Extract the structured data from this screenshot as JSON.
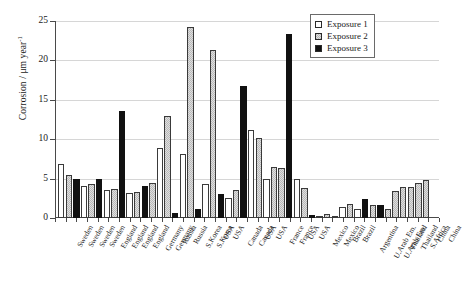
{
  "chart_data": {
    "type": "bar",
    "title": "",
    "xlabel": "",
    "ylabel": "Corrosion / μm year",
    "ylabel_exponent": "-1",
    "ylim": [
      0,
      25
    ],
    "yticks": [
      0,
      5,
      10,
      15,
      20,
      25
    ],
    "grid": true,
    "legend_position": "top-right",
    "legend": [
      "Exposure 1",
      "Exposure 2",
      "Exposure 3"
    ],
    "series_colors": {
      "Exposure 1": "#ffffff",
      "Exposure 2": "#b9b9b9",
      "Exposure 3": "#111111"
    },
    "categories": [
      "Sweden",
      "Sweden",
      "Sweden",
      "Sweden",
      "England",
      "England",
      "England",
      "England",
      "Germany",
      "Germany",
      "Russia",
      "Russia",
      "S.Korea",
      "S.Korea",
      "USA",
      "USA",
      "Canada",
      "Canada",
      "USA",
      "USA",
      "France",
      "France",
      "USA",
      "USA",
      "Mexico",
      "Mexico",
      "Brazil",
      "Brazil",
      "Argentina",
      "U.Arab Em.",
      "U.Arab Em.",
      "Thailand",
      "Thailand",
      "S.Africa",
      "China",
      "China"
    ],
    "series": [
      {
        "name": "Exposure 1",
        "values": [
          6.8,
          4.1,
          3.6,
          3.2,
          8.9,
          8.1,
          4.3,
          2.5,
          11.2,
          10.1,
          1.1,
          0.0,
          2.0,
          3.0,
          3.3,
          4.4,
          5.1,
          5.5,
          5.6,
          7.2,
          8.2,
          5.6,
          0.3,
          0.0,
          0.5,
          0.3,
          1.4,
          0.9,
          0.6,
          1.5,
          1.7,
          1.1,
          0.5,
          0.3,
          0.9,
          1.1
        ]
      },
      {
        "name": "Exposure 2",
        "values": [
          5.4,
          4.3,
          4.4,
          3.7,
          13.0,
          24.2,
          21.3,
          5.0,
          6.5,
          6.4,
          1.8,
          1.6,
          1.9,
          3.6,
          3.7,
          4.4,
          5.2,
          6.3,
          6.6,
          7.6,
          8.1,
          3.8,
          0.5,
          0.2,
          0.6,
          0.7,
          1.2,
          1.0,
          0.7,
          1.5,
          1.3,
          0.9,
          0.4,
          0.5,
          1.1,
          1.2
        ]
      },
      {
        "name": "Exposure 3",
        "values": [
          4.9,
          4.9,
          13.6,
          4.0,
          0.6,
          1.2,
          16.7,
          23.4,
          4.9,
          3.0,
          2.2,
          1.8,
          2.1,
          0.0,
          0.0,
          0.0,
          0.0,
          0.0,
          0.0,
          0.0,
          0.7,
          0.9,
          0.0,
          0.0,
          0.0,
          0.0,
          2.4,
          1.7,
          0.0,
          1.8,
          0.0,
          0.2,
          0.3,
          0.0,
          0.0,
          0.0
        ]
      }
    ],
    "bar_sequence": [
      {
        "label": "Sweden",
        "series": "Exposure 1",
        "value": 6.8
      },
      {
        "label": "Sweden",
        "series": "Exposure 2",
        "value": 5.4
      },
      {
        "label": "Sweden",
        "series": "Exposure 3",
        "value": 4.9
      },
      {
        "label": "Sweden",
        "series": "Exposure 1",
        "value": 4.1
      },
      {
        "label": "Sweden",
        "series": "Exposure 2",
        "value": 4.3
      },
      {
        "label": "Sweden",
        "series": "Exposure 3",
        "value": 4.9
      },
      {
        "label": "Sweden",
        "series": "Exposure 1",
        "value": 3.6
      },
      {
        "label": "Sweden",
        "series": "Exposure 3",
        "value": 13.6
      },
      {
        "label": "Sweden",
        "series": "Exposure 1",
        "value": 3.2
      },
      {
        "label": "Sweden",
        "series": "Exposure 2",
        "value": 3.3
      },
      {
        "label": "England",
        "series": "Exposure 2",
        "value": 4.4
      },
      {
        "label": "England",
        "series": "Exposure 3",
        "value": 4.0
      },
      {
        "label": "England",
        "series": "Exposure 1",
        "value": 8.9
      },
      {
        "label": "England",
        "series": "Exposure 2",
        "value": 13.0
      },
      {
        "label": "England",
        "series": "Exposure 3",
        "value": 0.6
      },
      {
        "label": "England",
        "series": "Exposure 2",
        "value": 24.2
      },
      {
        "label": "England",
        "series": "Exposure 1",
        "value": 8.1
      },
      {
        "label": "England",
        "series": "Exposure 3",
        "value": 1.2
      },
      {
        "label": "England",
        "series": "Exposure 2",
        "value": 21.3
      },
      {
        "label": "England",
        "series": "Exposure 1",
        "value": 4.3
      },
      {
        "label": "Germany",
        "series": "Exposure 3",
        "value": 3.0
      },
      {
        "label": "Germany",
        "series": "Exposure 1",
        "value": 2.5
      },
      {
        "label": "Germany",
        "series": "Exposure 3",
        "value": 16.7
      },
      {
        "label": "Germany",
        "series": "Exposure 1",
        "value": 11.2
      },
      {
        "label": "Germany",
        "series": "Exposure 2",
        "value": 3.6
      },
      {
        "label": "Germany",
        "series": "Exposure 1",
        "value": 10.1
      },
      {
        "label": "Russia",
        "series": "Exposure 2",
        "value": 5.0
      },
      {
        "label": "Russia",
        "series": "Exposure 1",
        "value": 6.5
      },
      {
        "label": "Russia",
        "series": "Exposure 3",
        "value": 23.4
      },
      {
        "label": "Russia",
        "series": "Exposure 2",
        "value": 4.9
      },
      {
        "label": "S.Korea",
        "series": "Exposure 1",
        "value": 6.4
      },
      {
        "label": "S.Korea",
        "series": "Exposure 2",
        "value": 3.8
      },
      {
        "label": "S.Korea",
        "series": "Exposure 3",
        "value": 2.2
      },
      {
        "label": "S.Korea",
        "series": "Exposure 1",
        "value": 1.4
      },
      {
        "label": "USA",
        "series": "Exposure 2",
        "value": 1.8
      },
      {
        "label": "USA",
        "series": "Exposure 3",
        "value": 2.4
      },
      {
        "label": "USA",
        "series": "Exposure 1",
        "value": 1.2
      },
      {
        "label": "USA",
        "series": "Exposure 3",
        "value": 1.8
      },
      {
        "label": "Canada",
        "series": "Exposure 2",
        "value": 1.9
      },
      {
        "label": "Canada",
        "series": "Exposure 1",
        "value": 3.4
      },
      {
        "label": "Canada",
        "series": "Exposure 2",
        "value": 3.9
      },
      {
        "label": "USA",
        "series": "Exposure 1",
        "value": 3.9
      },
      {
        "label": "USA",
        "series": "Exposure 2",
        "value": 4.5
      },
      {
        "label": "France",
        "series": "Exposure 1",
        "value": 4.8
      },
      {
        "label": "France",
        "series": "Exposure 2",
        "value": 5.2
      }
    ],
    "note": "Grouped bar chart of atmospheric corrosion rate by test site and exposure period."
  },
  "bars_render": [
    {
      "x": 2.0,
      "h": 6.8,
      "cls": "e1"
    },
    {
      "x": 9.6,
      "h": 5.4,
      "cls": "e2"
    },
    {
      "x": 17.2,
      "h": 4.9,
      "cls": "e3"
    },
    {
      "x": 24.8,
      "h": 4.1,
      "cls": "e1"
    },
    {
      "x": 32.4,
      "h": 4.3,
      "cls": "e2"
    },
    {
      "x": 40.0,
      "h": 4.9,
      "cls": "e3"
    },
    {
      "x": 47.6,
      "h": 3.6,
      "cls": "e1"
    },
    {
      "x": 55.2,
      "h": 3.7,
      "cls": "e2"
    },
    {
      "x": 62.8,
      "h": 13.6,
      "cls": "e3"
    },
    {
      "x": 70.4,
      "h": 3.2,
      "cls": "e1"
    },
    {
      "x": 78.0,
      "h": 3.3,
      "cls": "e2"
    },
    {
      "x": 85.6,
      "h": 4.0,
      "cls": "e3"
    },
    {
      "x": 93.2,
      "h": 4.4,
      "cls": "e2"
    },
    {
      "x": 100.8,
      "h": 8.9,
      "cls": "e1"
    },
    {
      "x": 108.4,
      "h": 13.0,
      "cls": "e2"
    },
    {
      "x": 116.0,
      "h": 0.6,
      "cls": "e3"
    },
    {
      "x": 123.6,
      "h": 8.1,
      "cls": "e1"
    },
    {
      "x": 131.2,
      "h": 24.2,
      "cls": "e2"
    },
    {
      "x": 138.8,
      "h": 1.2,
      "cls": "e3"
    },
    {
      "x": 146.4,
      "h": 4.3,
      "cls": "e1"
    },
    {
      "x": 154.0,
      "h": 21.3,
      "cls": "e2"
    },
    {
      "x": 161.6,
      "h": 3.0,
      "cls": "e3"
    },
    {
      "x": 169.2,
      "h": 2.5,
      "cls": "e1"
    },
    {
      "x": 176.8,
      "h": 3.6,
      "cls": "e2"
    },
    {
      "x": 184.4,
      "h": 16.7,
      "cls": "e3"
    },
    {
      "x": 192.0,
      "h": 11.2,
      "cls": "e1"
    },
    {
      "x": 199.6,
      "h": 10.1,
      "cls": "e2"
    },
    {
      "x": 207.2,
      "h": 5.0,
      "cls": "e1"
    },
    {
      "x": 214.8,
      "h": 6.5,
      "cls": "e2"
    },
    {
      "x": 222.4,
      "h": 6.4,
      "cls": "e2"
    },
    {
      "x": 230.0,
      "h": 23.4,
      "cls": "e3"
    },
    {
      "x": 237.6,
      "h": 4.9,
      "cls": "e1"
    },
    {
      "x": 245.2,
      "h": 3.8,
      "cls": "e2"
    },
    {
      "x": 252.8,
      "h": 0.4,
      "cls": "e3"
    },
    {
      "x": 260.4,
      "h": 0.3,
      "cls": "e1"
    },
    {
      "x": 268.0,
      "h": 0.5,
      "cls": "e2"
    },
    {
      "x": 275.6,
      "h": 0.2,
      "cls": "e1"
    },
    {
      "x": 283.2,
      "h": 1.4,
      "cls": "e1"
    },
    {
      "x": 290.8,
      "h": 1.8,
      "cls": "e2"
    },
    {
      "x": 298.4,
      "h": 1.1,
      "cls": "e1"
    },
    {
      "x": 306.0,
      "h": 2.4,
      "cls": "e3"
    },
    {
      "x": 313.6,
      "h": 1.6,
      "cls": "e2"
    },
    {
      "x": 321.2,
      "h": 1.7,
      "cls": "e3"
    },
    {
      "x": 328.8,
      "h": 1.2,
      "cls": "e2"
    },
    {
      "x": 336.4,
      "h": 3.4,
      "cls": "e2"
    },
    {
      "x": 344.0,
      "h": 3.9,
      "cls": "e2"
    },
    {
      "x": 351.6,
      "h": 3.9,
      "cls": "e2"
    },
    {
      "x": 359.2,
      "h": 4.5,
      "cls": "e2"
    },
    {
      "x": 366.8,
      "h": 4.8,
      "cls": "e2"
    }
  ],
  "xlabels": [
    "Sweden",
    "Sweden",
    "Sweden",
    "Sweden",
    "England",
    "England",
    "England",
    "England",
    "Germany",
    "Germany",
    "Russia",
    "Russia",
    "S.Korea",
    "S.Korea",
    "USA",
    "USA",
    "Canada",
    "Canada",
    "USA",
    "USA",
    "France",
    "France",
    "USA",
    "USA",
    "Mexico",
    "Mexico",
    "Brazil",
    "Brazil",
    "Argentina",
    "U.Arab Em.",
    "U.Arab Em.",
    "Thailand",
    "Thailand",
    "S.Africa",
    "China",
    "China"
  ],
  "yticks": [
    "0",
    "5",
    "10",
    "15",
    "20",
    "25"
  ],
  "legend": {
    "items": [
      {
        "label": "Exposure 1",
        "swatch": "exposure-1"
      },
      {
        "label": "Exposure 2",
        "swatch": "exposure-2"
      },
      {
        "label": "Exposure 3",
        "swatch": "exposure-3"
      }
    ]
  },
  "axis": {
    "ylabel_main": "Corrosion / μm year",
    "ylabel_sup": "-1"
  }
}
